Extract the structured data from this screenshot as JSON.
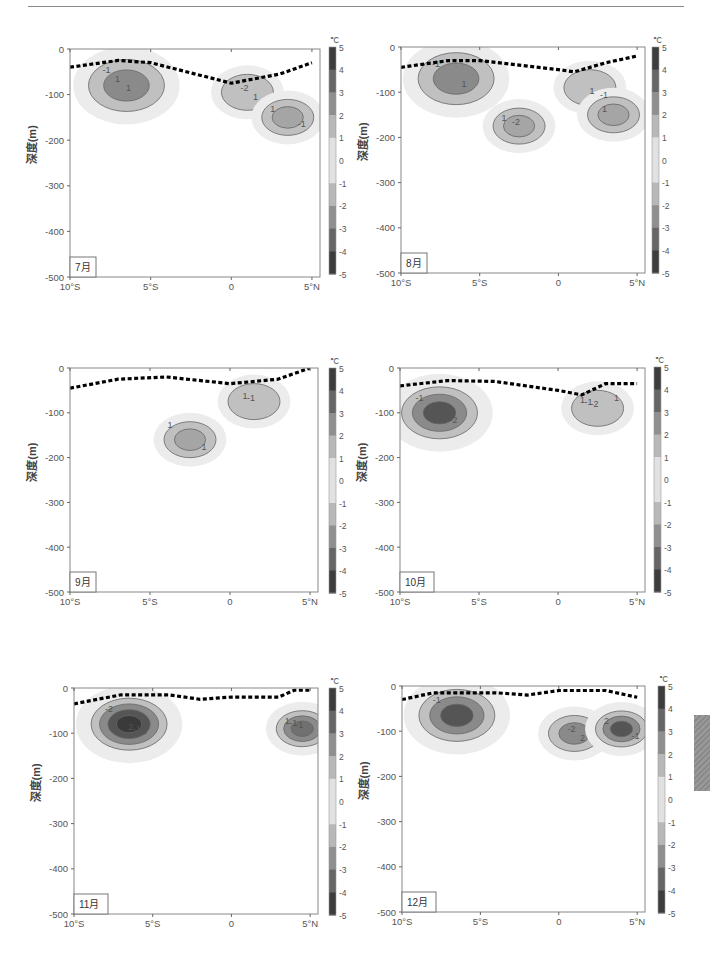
{
  "page": {
    "header_text_visible": false
  },
  "common": {
    "ylabel": "深度(m)",
    "colorbar_unit": "℃",
    "y_ticks": [
      "0",
      "-100",
      "-200",
      "-300",
      "-400",
      "-500"
    ],
    "x_ticks": [
      "10°S",
      "5°S",
      "0",
      "5°N"
    ],
    "colorbar_ticks": [
      "5",
      "4",
      "3",
      "2",
      "1",
      "0",
      "-1",
      "-2",
      "-3",
      "-4",
      "-5"
    ]
  },
  "chart_data": [
    {
      "type": "heatmap",
      "title": "7月",
      "xlabel": "",
      "ylabel": "深度(m)",
      "x_ticks": [
        "10°S",
        "5°S",
        "0",
        "5°N"
      ],
      "y_ticks": [
        0,
        -100,
        -200,
        -300,
        -400,
        -500
      ],
      "ylim": [
        -500,
        0
      ],
      "colorbar": {
        "unit": "℃",
        "range": [
          -5,
          5
        ],
        "ticks": [
          5,
          4,
          3,
          2,
          1,
          0,
          -1,
          -2,
          -3,
          -4,
          -5
        ]
      },
      "contour_labels": [
        "-1",
        "-2",
        "-1",
        "1",
        "1",
        "1",
        "1"
      ],
      "thermocline_dashed": [
        [
          -10,
          -40
        ],
        [
          -7,
          -25
        ],
        [
          -5,
          -30
        ],
        [
          0,
          -75
        ],
        [
          3,
          -55
        ],
        [
          5,
          -30
        ]
      ],
      "features": [
        {
          "kind": "cold",
          "center_lat": -6.5,
          "center_depth": -80,
          "min": -2
        },
        {
          "kind": "warm",
          "center_lat": 1,
          "center_depth": -95,
          "max": 1
        },
        {
          "kind": "warm",
          "center_lat": 3.5,
          "center_depth": -150,
          "max": 1.5
        }
      ]
    },
    {
      "type": "heatmap",
      "title": "8月",
      "xlabel": "",
      "ylabel": "深度(m)",
      "x_ticks": [
        "10°S",
        "5°S",
        "0",
        "5°N"
      ],
      "y_ticks": [
        0,
        -100,
        -200,
        -300,
        -400,
        -500
      ],
      "ylim": [
        -500,
        0
      ],
      "colorbar": {
        "unit": "℃",
        "range": [
          -5,
          5
        ],
        "ticks": [
          5,
          4,
          3,
          2,
          1,
          0,
          -1,
          -2,
          -3,
          -4,
          -5
        ]
      },
      "contour_labels": [
        "-1",
        "-2",
        "-1",
        "1",
        "1",
        "1",
        "1"
      ],
      "thermocline_dashed": [
        [
          -10,
          -45
        ],
        [
          -7,
          -30
        ],
        [
          -5,
          -30
        ],
        [
          0,
          -50
        ],
        [
          1,
          -55
        ],
        [
          3,
          -35
        ],
        [
          5,
          -20
        ]
      ],
      "features": [
        {
          "kind": "cold",
          "center_lat": -6.5,
          "center_depth": -70,
          "min": -2
        },
        {
          "kind": "warm",
          "center_lat": -2.5,
          "center_depth": -175,
          "max": 1.5
        },
        {
          "kind": "warm",
          "center_lat": 2,
          "center_depth": -90,
          "max": 1
        },
        {
          "kind": "warm",
          "center_lat": 3.5,
          "center_depth": -150,
          "max": 1.5
        }
      ]
    },
    {
      "type": "heatmap",
      "title": "9月",
      "xlabel": "",
      "ylabel": "深度(m)",
      "x_ticks": [
        "10°S",
        "5°S",
        "0",
        "5°N"
      ],
      "y_ticks": [
        0,
        -100,
        -200,
        -300,
        -400,
        -500
      ],
      "ylim": [
        -500,
        0
      ],
      "colorbar": {
        "unit": "℃",
        "range": [
          -5,
          5
        ],
        "ticks": [
          5,
          4,
          3,
          2,
          1,
          0,
          -1,
          -2,
          -3,
          -4,
          -5
        ]
      },
      "contour_labels": [
        "1",
        "-1",
        "1",
        "1"
      ],
      "thermocline_dashed": [
        [
          -10,
          -45
        ],
        [
          -7,
          -25
        ],
        [
          -4,
          -20
        ],
        [
          0,
          -35
        ],
        [
          3,
          -25
        ],
        [
          5,
          0
        ]
      ],
      "features": [
        {
          "kind": "warm",
          "center_lat": -2.5,
          "center_depth": -160,
          "max": 1.5
        },
        {
          "kind": "warm",
          "center_lat": 1.5,
          "center_depth": -75,
          "max": 1
        }
      ]
    },
    {
      "type": "heatmap",
      "title": "10月",
      "xlabel": "",
      "ylabel": "深度(m)",
      "x_ticks": [
        "10°S",
        "5°S",
        "0",
        "5°N"
      ],
      "y_ticks": [
        0,
        -100,
        -200,
        -300,
        -400,
        -500
      ],
      "ylim": [
        -500,
        0
      ],
      "colorbar": {
        "unit": "℃",
        "range": [
          -5,
          5
        ],
        "ticks": [
          5,
          4,
          3,
          2,
          1,
          0,
          -1,
          -2,
          -3,
          -4,
          -5
        ]
      },
      "contour_labels": [
        "-1",
        "-2",
        "-2",
        "-1",
        "1",
        "1",
        "1",
        "1"
      ],
      "thermocline_dashed": [
        [
          -10,
          -40
        ],
        [
          -7,
          -28
        ],
        [
          -4,
          -30
        ],
        [
          0,
          -50
        ],
        [
          1.5,
          -60
        ],
        [
          3,
          -35
        ],
        [
          5,
          -35
        ]
      ],
      "features": [
        {
          "kind": "cold",
          "center_lat": -7.5,
          "center_depth": -100,
          "min": -3
        },
        {
          "kind": "warm",
          "center_lat": 2.5,
          "center_depth": -90,
          "max": 1
        }
      ]
    },
    {
      "type": "heatmap",
      "title": "11月",
      "xlabel": "",
      "ylabel": "深度(m)",
      "x_ticks": [
        "10°S",
        "5°S",
        "0",
        "5°N"
      ],
      "y_ticks": [
        0,
        -100,
        -200,
        -300,
        -400,
        -500
      ],
      "ylim": [
        -500,
        0
      ],
      "colorbar": {
        "unit": "℃",
        "range": [
          -5,
          5
        ],
        "ticks": [
          5,
          4,
          3,
          2,
          1,
          0,
          -1,
          -2,
          -3,
          -4,
          -5
        ]
      },
      "contour_labels": [
        "-2",
        "-1",
        "-1",
        "-1",
        "-1",
        "1",
        "2",
        "1"
      ],
      "thermocline_dashed": [
        [
          -10,
          -35
        ],
        [
          -7,
          -15
        ],
        [
          -4,
          -15
        ],
        [
          -2,
          -25
        ],
        [
          0,
          -20
        ],
        [
          3,
          -20
        ],
        [
          4,
          -5
        ],
        [
          5,
          -5
        ]
      ],
      "features": [
        {
          "kind": "cold",
          "center_lat": -6.5,
          "center_depth": -80,
          "min": -3.5
        },
        {
          "kind": "warm",
          "center_lat": 4.5,
          "center_depth": -90,
          "max": 2.5
        }
      ]
    },
    {
      "type": "heatmap",
      "title": "12月",
      "xlabel": "",
      "ylabel": "深度(m)",
      "x_ticks": [
        "10°S",
        "5°S",
        "0",
        "5°N"
      ],
      "y_ticks": [
        0,
        -100,
        -200,
        -300,
        -400,
        -500
      ],
      "ylim": [
        -500,
        0
      ],
      "colorbar": {
        "unit": "℃",
        "range": [
          -5,
          5
        ],
        "ticks": [
          5,
          4,
          3,
          2,
          1,
          0,
          -1,
          -2,
          -3,
          -4,
          -5
        ]
      },
      "contour_labels": [
        "-1",
        "-2",
        "-1",
        "1",
        "2",
        "2",
        "1"
      ],
      "thermocline_dashed": [
        [
          -10,
          -30
        ],
        [
          -8,
          -15
        ],
        [
          -4,
          -15
        ],
        [
          -2,
          -20
        ],
        [
          0,
          -10
        ],
        [
          3,
          -10
        ],
        [
          5,
          -25
        ]
      ],
      "features": [
        {
          "kind": "cold",
          "center_lat": -6.5,
          "center_depth": -65,
          "min": -3
        },
        {
          "kind": "warm",
          "center_lat": 1,
          "center_depth": -105,
          "max": 2
        },
        {
          "kind": "warm",
          "center_lat": 4,
          "center_depth": -95,
          "max": 3
        }
      ]
    }
  ]
}
